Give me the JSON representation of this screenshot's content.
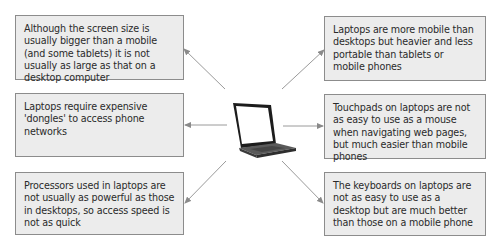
{
  "diagram": {
    "center": {
      "label": "laptop-image"
    },
    "boxes": {
      "top_left": "Although the screen size is usually bigger than a mobile (and some tablets) it is not usually as large as that on a desktop computer",
      "middle_left": "Laptops require expensive 'dongles' to access phone networks",
      "bottom_left": "Processors used in laptops are not usually as powerful as those in desktops, so access speed is not as quick",
      "top_right": "Laptops are more mobile than desktops but heavier and less portable than tablets or mobile phones",
      "middle_right": "Touchpads on laptops are not as easy to use as a mouse when navigating web pages, but much easier than mobile phones",
      "bottom_right": "The keyboards on laptops are not as easy to use as a desktop but are much better than those on a mobile phone"
    },
    "colors": {
      "box_fill": "#ececec",
      "box_border": "#8c8c8c",
      "arrow": "#8a8a8a"
    }
  }
}
